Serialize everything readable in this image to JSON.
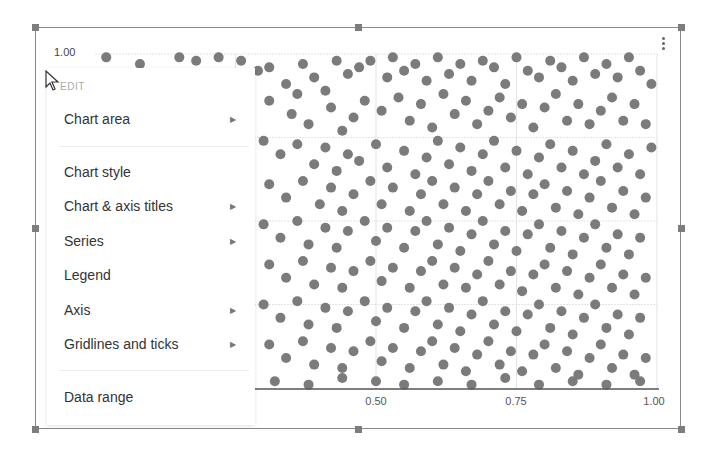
{
  "chart": {
    "ylabel_top": "1.00",
    "x_ticks": [
      {
        "label": "0.50",
        "x": 376
      },
      {
        "label": "0.75",
        "x": 516
      },
      {
        "label": "1.00",
        "x": 654
      }
    ],
    "dot_color": "#7b7b7b",
    "grid_color": "#e3e3e3",
    "axis_color": "#555555"
  },
  "menu": {
    "header": "EDIT",
    "items": [
      {
        "label": "Chart area",
        "submenu": true
      },
      {
        "label": "Chart style",
        "submenu": false
      },
      {
        "label": "Chart & axis titles",
        "submenu": true
      },
      {
        "label": "Series",
        "submenu": true
      },
      {
        "label": "Legend",
        "submenu": false
      },
      {
        "label": "Axis",
        "submenu": true
      },
      {
        "label": "Gridlines and ticks",
        "submenu": true
      },
      {
        "label": "Data range",
        "submenu": false
      }
    ],
    "arrow_glyph": "▶"
  },
  "chart_data": {
    "type": "scatter",
    "title": "",
    "xlabel": "",
    "ylabel": "",
    "xlim": [
      0,
      1
    ],
    "ylim": [
      0,
      1
    ],
    "x_tick_labels": [
      "0.50",
      "0.75",
      "1.00"
    ],
    "y_tick_labels": [
      "1.00"
    ],
    "grid": true,
    "legend": "none",
    "series": [
      {
        "name": "points",
        "points": [
          [
            0.02,
            0.99
          ],
          [
            0.08,
            0.97
          ],
          [
            0.15,
            0.99
          ],
          [
            0.18,
            0.98
          ],
          [
            0.22,
            0.99
          ],
          [
            0.26,
            0.98
          ],
          [
            0.29,
            0.95
          ],
          [
            0.31,
            0.96
          ],
          [
            0.34,
            0.91
          ],
          [
            0.36,
            0.88
          ],
          [
            0.37,
            0.97
          ],
          [
            0.39,
            0.93
          ],
          [
            0.41,
            0.89
          ],
          [
            0.43,
            0.98
          ],
          [
            0.45,
            0.94
          ],
          [
            0.47,
            0.96
          ],
          [
            0.49,
            0.98
          ],
          [
            0.52,
            0.93
          ],
          [
            0.53,
            0.99
          ],
          [
            0.55,
            0.95
          ],
          [
            0.57,
            0.97
          ],
          [
            0.59,
            0.92
          ],
          [
            0.61,
            0.99
          ],
          [
            0.63,
            0.94
          ],
          [
            0.65,
            0.97
          ],
          [
            0.67,
            0.92
          ],
          [
            0.69,
            0.98
          ],
          [
            0.71,
            0.96
          ],
          [
            0.73,
            0.91
          ],
          [
            0.75,
            0.99
          ],
          [
            0.77,
            0.95
          ],
          [
            0.79,
            0.93
          ],
          [
            0.81,
            0.98
          ],
          [
            0.83,
            0.96
          ],
          [
            0.85,
            0.92
          ],
          [
            0.87,
            0.99
          ],
          [
            0.89,
            0.94
          ],
          [
            0.91,
            0.97
          ],
          [
            0.93,
            0.93
          ],
          [
            0.95,
            0.99
          ],
          [
            0.97,
            0.95
          ],
          [
            0.99,
            0.91
          ],
          [
            0.31,
            0.86
          ],
          [
            0.35,
            0.82
          ],
          [
            0.38,
            0.79
          ],
          [
            0.42,
            0.84
          ],
          [
            0.44,
            0.77
          ],
          [
            0.46,
            0.81
          ],
          [
            0.48,
            0.86
          ],
          [
            0.51,
            0.83
          ],
          [
            0.54,
            0.87
          ],
          [
            0.56,
            0.8
          ],
          [
            0.58,
            0.85
          ],
          [
            0.6,
            0.78
          ],
          [
            0.62,
            0.88
          ],
          [
            0.64,
            0.82
          ],
          [
            0.66,
            0.86
          ],
          [
            0.68,
            0.79
          ],
          [
            0.7,
            0.83
          ],
          [
            0.72,
            0.87
          ],
          [
            0.74,
            0.81
          ],
          [
            0.76,
            0.85
          ],
          [
            0.78,
            0.78
          ],
          [
            0.8,
            0.84
          ],
          [
            0.82,
            0.88
          ],
          [
            0.84,
            0.8
          ],
          [
            0.86,
            0.85
          ],
          [
            0.88,
            0.79
          ],
          [
            0.9,
            0.83
          ],
          [
            0.92,
            0.87
          ],
          [
            0.94,
            0.8
          ],
          [
            0.96,
            0.85
          ],
          [
            0.98,
            0.79
          ],
          [
            0.3,
            0.74
          ],
          [
            0.33,
            0.7
          ],
          [
            0.36,
            0.73
          ],
          [
            0.39,
            0.67
          ],
          [
            0.41,
            0.72
          ],
          [
            0.43,
            0.65
          ],
          [
            0.45,
            0.7
          ],
          [
            0.47,
            0.68
          ],
          [
            0.5,
            0.73
          ],
          [
            0.52,
            0.66
          ],
          [
            0.55,
            0.71
          ],
          [
            0.57,
            0.64
          ],
          [
            0.59,
            0.69
          ],
          [
            0.61,
            0.74
          ],
          [
            0.63,
            0.67
          ],
          [
            0.65,
            0.72
          ],
          [
            0.67,
            0.65
          ],
          [
            0.69,
            0.7
          ],
          [
            0.71,
            0.74
          ],
          [
            0.73,
            0.66
          ],
          [
            0.75,
            0.71
          ],
          [
            0.77,
            0.64
          ],
          [
            0.79,
            0.69
          ],
          [
            0.81,
            0.73
          ],
          [
            0.83,
            0.66
          ],
          [
            0.85,
            0.71
          ],
          [
            0.87,
            0.64
          ],
          [
            0.89,
            0.68
          ],
          [
            0.91,
            0.73
          ],
          [
            0.93,
            0.66
          ],
          [
            0.95,
            0.7
          ],
          [
            0.97,
            0.64
          ],
          [
            0.99,
            0.72
          ],
          [
            0.31,
            0.61
          ],
          [
            0.34,
            0.57
          ],
          [
            0.37,
            0.62
          ],
          [
            0.4,
            0.55
          ],
          [
            0.42,
            0.6
          ],
          [
            0.44,
            0.53
          ],
          [
            0.46,
            0.58
          ],
          [
            0.49,
            0.62
          ],
          [
            0.51,
            0.55
          ],
          [
            0.53,
            0.6
          ],
          [
            0.56,
            0.53
          ],
          [
            0.58,
            0.58
          ],
          [
            0.6,
            0.62
          ],
          [
            0.62,
            0.55
          ],
          [
            0.64,
            0.6
          ],
          [
            0.66,
            0.53
          ],
          [
            0.68,
            0.58
          ],
          [
            0.7,
            0.62
          ],
          [
            0.72,
            0.55
          ],
          [
            0.74,
            0.59
          ],
          [
            0.76,
            0.53
          ],
          [
            0.78,
            0.58
          ],
          [
            0.8,
            0.61
          ],
          [
            0.82,
            0.54
          ],
          [
            0.84,
            0.59
          ],
          [
            0.86,
            0.52
          ],
          [
            0.88,
            0.57
          ],
          [
            0.9,
            0.62
          ],
          [
            0.92,
            0.54
          ],
          [
            0.94,
            0.59
          ],
          [
            0.96,
            0.52
          ],
          [
            0.98,
            0.57
          ],
          [
            0.3,
            0.49
          ],
          [
            0.33,
            0.45
          ],
          [
            0.36,
            0.5
          ],
          [
            0.38,
            0.43
          ],
          [
            0.41,
            0.48
          ],
          [
            0.43,
            0.42
          ],
          [
            0.45,
            0.47
          ],
          [
            0.48,
            0.5
          ],
          [
            0.5,
            0.44
          ],
          [
            0.52,
            0.48
          ],
          [
            0.55,
            0.42
          ],
          [
            0.57,
            0.47
          ],
          [
            0.59,
            0.5
          ],
          [
            0.61,
            0.43
          ],
          [
            0.63,
            0.48
          ],
          [
            0.65,
            0.41
          ],
          [
            0.67,
            0.46
          ],
          [
            0.69,
            0.5
          ],
          [
            0.71,
            0.43
          ],
          [
            0.73,
            0.47
          ],
          [
            0.75,
            0.41
          ],
          [
            0.77,
            0.46
          ],
          [
            0.79,
            0.49
          ],
          [
            0.81,
            0.42
          ],
          [
            0.83,
            0.47
          ],
          [
            0.85,
            0.4
          ],
          [
            0.87,
            0.45
          ],
          [
            0.89,
            0.49
          ],
          [
            0.91,
            0.42
          ],
          [
            0.93,
            0.46
          ],
          [
            0.95,
            0.4
          ],
          [
            0.97,
            0.45
          ],
          [
            0.31,
            0.37
          ],
          [
            0.34,
            0.33
          ],
          [
            0.37,
            0.38
          ],
          [
            0.39,
            0.31
          ],
          [
            0.42,
            0.36
          ],
          [
            0.44,
            0.3
          ],
          [
            0.46,
            0.35
          ],
          [
            0.49,
            0.38
          ],
          [
            0.51,
            0.32
          ],
          [
            0.53,
            0.36
          ],
          [
            0.56,
            0.3
          ],
          [
            0.58,
            0.35
          ],
          [
            0.6,
            0.38
          ],
          [
            0.62,
            0.31
          ],
          [
            0.64,
            0.36
          ],
          [
            0.66,
            0.3
          ],
          [
            0.68,
            0.34
          ],
          [
            0.7,
            0.38
          ],
          [
            0.72,
            0.31
          ],
          [
            0.74,
            0.35
          ],
          [
            0.76,
            0.29
          ],
          [
            0.78,
            0.34
          ],
          [
            0.8,
            0.37
          ],
          [
            0.82,
            0.3
          ],
          [
            0.84,
            0.35
          ],
          [
            0.86,
            0.28
          ],
          [
            0.88,
            0.33
          ],
          [
            0.9,
            0.37
          ],
          [
            0.92,
            0.3
          ],
          [
            0.94,
            0.34
          ],
          [
            0.96,
            0.28
          ],
          [
            0.98,
            0.33
          ],
          [
            0.3,
            0.25
          ],
          [
            0.33,
            0.21
          ],
          [
            0.36,
            0.26
          ],
          [
            0.38,
            0.19
          ],
          [
            0.41,
            0.24
          ],
          [
            0.43,
            0.18
          ],
          [
            0.45,
            0.23
          ],
          [
            0.48,
            0.26
          ],
          [
            0.5,
            0.2
          ],
          [
            0.52,
            0.24
          ],
          [
            0.55,
            0.18
          ],
          [
            0.57,
            0.23
          ],
          [
            0.59,
            0.26
          ],
          [
            0.61,
            0.19
          ],
          [
            0.63,
            0.24
          ],
          [
            0.65,
            0.17
          ],
          [
            0.67,
            0.22
          ],
          [
            0.69,
            0.26
          ],
          [
            0.71,
            0.19
          ],
          [
            0.73,
            0.23
          ],
          [
            0.75,
            0.17
          ],
          [
            0.77,
            0.22
          ],
          [
            0.79,
            0.25
          ],
          [
            0.81,
            0.18
          ],
          [
            0.83,
            0.23
          ],
          [
            0.85,
            0.16
          ],
          [
            0.87,
            0.21
          ],
          [
            0.89,
            0.25
          ],
          [
            0.91,
            0.18
          ],
          [
            0.93,
            0.22
          ],
          [
            0.95,
            0.16
          ],
          [
            0.97,
            0.21
          ],
          [
            0.31,
            0.13
          ],
          [
            0.34,
            0.09
          ],
          [
            0.37,
            0.14
          ],
          [
            0.39,
            0.07
          ],
          [
            0.42,
            0.12
          ],
          [
            0.44,
            0.06
          ],
          [
            0.46,
            0.11
          ],
          [
            0.49,
            0.14
          ],
          [
            0.51,
            0.08
          ],
          [
            0.53,
            0.12
          ],
          [
            0.56,
            0.06
          ],
          [
            0.58,
            0.11
          ],
          [
            0.6,
            0.14
          ],
          [
            0.62,
            0.07
          ],
          [
            0.64,
            0.12
          ],
          [
            0.66,
            0.05
          ],
          [
            0.68,
            0.1
          ],
          [
            0.7,
            0.14
          ],
          [
            0.72,
            0.07
          ],
          [
            0.74,
            0.11
          ],
          [
            0.76,
            0.05
          ],
          [
            0.78,
            0.1
          ],
          [
            0.8,
            0.13
          ],
          [
            0.82,
            0.06
          ],
          [
            0.84,
            0.11
          ],
          [
            0.86,
            0.04
          ],
          [
            0.88,
            0.09
          ],
          [
            0.9,
            0.13
          ],
          [
            0.92,
            0.06
          ],
          [
            0.94,
            0.1
          ],
          [
            0.96,
            0.04
          ],
          [
            0.98,
            0.09
          ],
          [
            0.32,
            0.02
          ],
          [
            0.38,
            0.01
          ],
          [
            0.44,
            0.03
          ],
          [
            0.5,
            0.02
          ],
          [
            0.55,
            0.01
          ],
          [
            0.61,
            0.02
          ],
          [
            0.67,
            0.01
          ],
          [
            0.73,
            0.03
          ],
          [
            0.79,
            0.01
          ],
          [
            0.85,
            0.02
          ],
          [
            0.91,
            0.01
          ],
          [
            0.97,
            0.02
          ]
        ]
      }
    ]
  }
}
